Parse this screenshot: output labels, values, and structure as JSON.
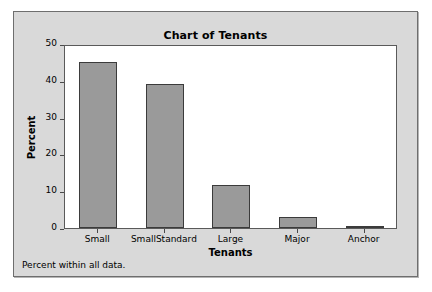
{
  "window": {
    "background_color": "#d9d9d9",
    "border_color": "#6e6e6e"
  },
  "chart_data": {
    "type": "bar",
    "title": "Chart of Tenants",
    "xlabel": "Tenants",
    "ylabel": "Percent",
    "categories": [
      "Small",
      "SmallStandard",
      "Large",
      "Major",
      "Anchor"
    ],
    "values": [
      45,
      39,
      11.6,
      3,
      0.5
    ],
    "ylim": [
      0,
      50
    ],
    "yticks": [
      0,
      10,
      20,
      30,
      40,
      50
    ],
    "ytick_labels": [
      "0",
      "10",
      "20",
      "30",
      "40",
      "50"
    ],
    "grid": false,
    "legend": null,
    "footnote": "Percent within all data.",
    "bar_fill_color": "#9a9a9a",
    "bar_border_color": "#3b3b3b",
    "plot_background_color": "#ffffff",
    "axis_color": "#5a5a5a"
  }
}
